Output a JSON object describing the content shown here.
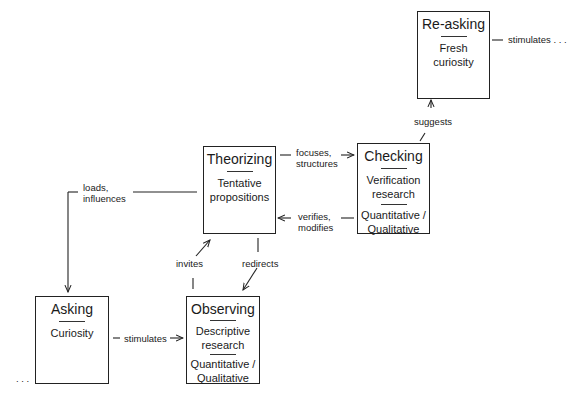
{
  "diagram": {
    "nodes": [
      {
        "id": "re-asking",
        "title": "Re-asking",
        "sections": [
          "Fresh curiosity"
        ]
      },
      {
        "id": "theorizing",
        "title": "Theorizing",
        "sections": [
          "Tentative propositions"
        ]
      },
      {
        "id": "checking",
        "title": "Checking",
        "sections": [
          "Verification research",
          "Quantitative / Qualitative"
        ]
      },
      {
        "id": "asking",
        "title": "Asking",
        "sections": [
          "Curiosity"
        ]
      },
      {
        "id": "observing",
        "title": "Observing",
        "sections": [
          "Descriptive research",
          "Quantitative / Qualitative"
        ]
      }
    ],
    "edges": [
      {
        "from": "theorizing",
        "to": "checking",
        "label": "focuses, structures"
      },
      {
        "from": "checking",
        "to": "theorizing",
        "label": "verifies, modifies"
      },
      {
        "from": "checking",
        "to": "re-asking",
        "label": "suggests"
      },
      {
        "from": "re-asking",
        "to": "...",
        "label": "stimulates . . ."
      },
      {
        "from": "theorizing",
        "to": "asking",
        "label": "loads, influences"
      },
      {
        "from": "observing",
        "to": "theorizing",
        "label": "invites"
      },
      {
        "from": "theorizing",
        "to": "observing",
        "label": "redirects"
      },
      {
        "from": "asking",
        "to": "observing",
        "label": "stimulates"
      }
    ]
  },
  "boxes": {
    "reasking": {
      "title": "Re-asking",
      "line1": "Fresh",
      "line2": "curiosity"
    },
    "theorizing": {
      "title": "Theorizing",
      "line1": "Tentative",
      "line2": "propositions"
    },
    "checking": {
      "title": "Checking",
      "line1": "Verification",
      "line2": "research",
      "line3": "Quantitative /",
      "line4": "Qualitative"
    },
    "asking": {
      "title": "Asking",
      "line1": "Curiosity"
    },
    "observing": {
      "title": "Observing",
      "line1": "Descriptive",
      "line2": "research",
      "line3": "Quantitative /",
      "line4": "Qualitative"
    }
  },
  "labels": {
    "stimulates_top": "stimulates . . .",
    "suggests": "suggests",
    "focuses_1": "focuses,",
    "focuses_2": "structures",
    "verifies_1": "verifies,",
    "verifies_2": "modifies",
    "loads_1": "loads,",
    "loads_2": "influences",
    "invites": "invites",
    "redirects": "redirects",
    "stimulates_bottom": "stimulates",
    "ellipsis_left": ". . ."
  },
  "colors": {
    "line": "#222222",
    "background": "#ffffff"
  }
}
